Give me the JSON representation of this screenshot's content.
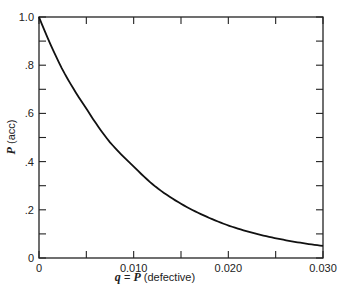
{
  "chart_data": {
    "type": "line",
    "title": "",
    "xlabel": "q = P (defective)",
    "ylabel": "P (acc)",
    "xlim": [
      0,
      0.03
    ],
    "ylim": [
      0,
      1.0
    ],
    "grid": false,
    "legend": null,
    "x_ticks": [
      0,
      0.005,
      0.01,
      0.015,
      0.02,
      0.025,
      0.03
    ],
    "x_tick_labels": [
      "0",
      "",
      "0.010",
      "",
      "0.020",
      "",
      "0.030"
    ],
    "y_ticks": [
      0,
      0.1,
      0.2,
      0.3,
      0.4,
      0.5,
      0.6,
      0.7,
      0.8,
      0.9,
      1.0
    ],
    "y_tick_labels": [
      "0",
      "",
      ".2",
      "",
      ".4",
      "",
      ".6",
      "",
      ".8",
      "",
      "1.0"
    ],
    "series": [
      {
        "name": "OC curve",
        "x": [
          0,
          0.0025,
          0.005,
          0.0075,
          0.01,
          0.0125,
          0.015,
          0.0175,
          0.02,
          0.0225,
          0.025,
          0.0275,
          0.03
        ],
        "values": [
          1.0,
          0.78,
          0.62,
          0.48,
          0.38,
          0.29,
          0.225,
          0.175,
          0.135,
          0.105,
          0.082,
          0.064,
          0.05
        ]
      }
    ]
  },
  "labels": {
    "ylabel_var": "P",
    "ylabel_rest": " (acc)",
    "xlabel_var1": "q",
    "xlabel_eq": " = ",
    "xlabel_var2": "P",
    "xlabel_rest": " (defective)"
  }
}
